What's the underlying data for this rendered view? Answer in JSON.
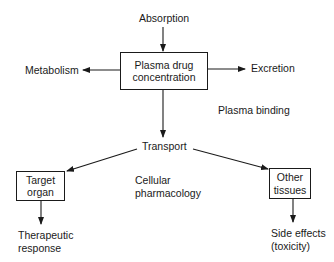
{
  "diagram": {
    "top_input": "Absorption",
    "central_box": {
      "line1": "Plasma drug",
      "line2": "concentration"
    },
    "left_output": "Metabolism",
    "right_output": "Excretion",
    "side_note": "Plasma binding",
    "transport": "Transport",
    "center_note": {
      "line1": "Cellular",
      "line2": "pharmacology"
    },
    "left_box": {
      "line1": "Target",
      "line2": "organ"
    },
    "right_box": {
      "line1": "Other",
      "line2": "tissues"
    },
    "left_result": {
      "line1": "Therapeutic",
      "line2": "response"
    },
    "right_result": {
      "line1": "Side effects",
      "line2": "(toxicity)"
    }
  }
}
